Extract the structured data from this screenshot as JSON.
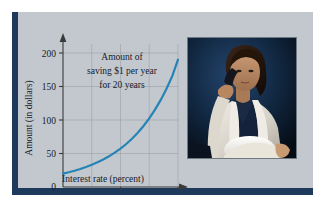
{
  "figure": {
    "background_color": "#ffffff",
    "panel_color": "#c3c8ce",
    "rail_color": "#1d3a5c"
  },
  "chart_data": {
    "type": "line",
    "title": "",
    "annotation": {
      "line1": "Amount of",
      "line2": "saving $1 per year",
      "line3": "for 20 years"
    },
    "xlabel": "Interest rate (percent)",
    "ylabel": "Amount (in dollars)",
    "xlim": [
      0,
      21
    ],
    "ylim": [
      0,
      205
    ],
    "xticks": [
      0,
      10,
      20
    ],
    "xtick_labels": [
      "0",
      "10",
      "20"
    ],
    "yticks": [
      0,
      50,
      100,
      150,
      200
    ],
    "ytick_labels": [
      "0",
      "50",
      "100",
      "150",
      "200"
    ],
    "gridlines_x": [
      5,
      10,
      15,
      20
    ],
    "gridlines_y": [
      50,
      100,
      150,
      200
    ],
    "grid": true,
    "legend": "none",
    "series": [
      {
        "name": "Future value of $1/year for 20 years",
        "color": "#2683b5",
        "x": [
          0,
          1,
          2,
          3,
          4,
          5,
          6,
          7,
          8,
          9,
          10,
          11,
          12,
          13,
          14,
          15,
          16,
          17,
          18,
          19,
          20
        ],
        "y": [
          20,
          22,
          24.3,
          26.9,
          29.8,
          33.1,
          36.8,
          41.0,
          45.8,
          51.2,
          57.3,
          64.2,
          72.1,
          81.0,
          91.0,
          102.4,
          115.4,
          130.0,
          146.6,
          165.4,
          190.0
        ]
      }
    ]
  },
  "photo": {
    "alt_description": "Woman in white jacket talking on a telephone while reading papers",
    "background_color": "#0d1c33",
    "border_color": "#6e7880"
  }
}
